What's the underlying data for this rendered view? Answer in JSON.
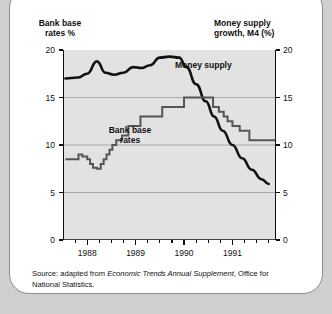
{
  "figure": {
    "left_axis_title": "Bank base\nrates %",
    "right_axis_title": "Money supply\ngrowth, M4 (%)",
    "money_supply_label": "Money supply",
    "bank_base_label": "Bank base\nrates",
    "source_prefix": "Source: adapted from ",
    "source_italic": "Economic Trends Annual Supplement",
    "source_suffix": ", Office for National Statistics."
  },
  "chart_data": {
    "type": "line",
    "title": "",
    "xlabel": "",
    "ylabel": "Bank base rates %",
    "y2label": "Money supply growth, M4 (%)",
    "ylim": [
      0,
      20
    ],
    "y2lim": [
      0,
      20
    ],
    "yticks": [
      0,
      5,
      10,
      15,
      20
    ],
    "y2ticks": [
      0,
      5,
      10,
      15,
      20
    ],
    "xlim": [
      1987.5,
      1991.9
    ],
    "xtick_labels": [
      "1988",
      "1989",
      "1990",
      "1991"
    ],
    "xtick_values": [
      1988.0,
      1989.0,
      1990.0,
      1991.0
    ],
    "grid": "horizontal",
    "legend": "inline-annotations",
    "series": [
      {
        "name": "Money supply",
        "style": "smooth-line",
        "color": "#111111",
        "axis": "right",
        "x": [
          1987.55,
          1987.8,
          1988.0,
          1988.2,
          1988.38,
          1988.55,
          1988.75,
          1988.95,
          1989.12,
          1989.3,
          1989.5,
          1989.7,
          1989.9,
          1990.05,
          1990.25,
          1990.45,
          1990.62,
          1990.8,
          1991.0,
          1991.2,
          1991.4,
          1991.6,
          1991.75
        ],
        "values": [
          17.0,
          17.1,
          17.5,
          18.8,
          17.6,
          17.4,
          17.6,
          18.2,
          18.1,
          18.4,
          19.2,
          19.3,
          19.2,
          18.2,
          16.4,
          14.6,
          13.0,
          11.5,
          10.0,
          8.6,
          7.4,
          6.4,
          5.9
        ]
      },
      {
        "name": "Bank base rates",
        "style": "step-line",
        "color": "#555555",
        "axis": "left",
        "x": [
          1987.55,
          1987.7,
          1987.82,
          1987.9,
          1988.0,
          1988.06,
          1988.12,
          1988.2,
          1988.28,
          1988.34,
          1988.4,
          1988.46,
          1988.52,
          1988.6,
          1988.72,
          1988.85,
          1989.1,
          1989.55,
          1990.0,
          1990.45,
          1990.6,
          1990.72,
          1990.82,
          1990.9,
          1991.0,
          1991.15,
          1991.35,
          1991.9
        ],
        "values": [
          8.5,
          8.5,
          9.0,
          8.8,
          8.5,
          8.0,
          7.6,
          7.5,
          8.0,
          8.5,
          9.0,
          9.5,
          10.0,
          10.5,
          11.0,
          12.0,
          13.0,
          14.0,
          15.0,
          15.0,
          14.0,
          13.5,
          13.0,
          12.5,
          12.0,
          11.5,
          10.5,
          10.5
        ]
      }
    ]
  }
}
